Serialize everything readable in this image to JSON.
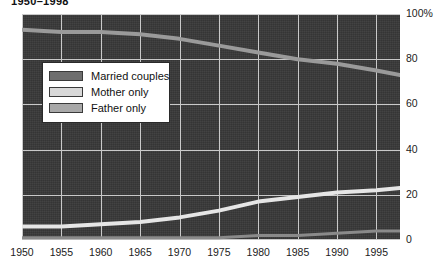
{
  "title": "1950–1998",
  "legend": {
    "items": [
      {
        "label": "Married couples",
        "color": "#6e6e6e",
        "name": "married-couples"
      },
      {
        "label": "Mother only",
        "color": "#d8d8d8",
        "name": "mother-only"
      },
      {
        "label": "Father only",
        "color": "#a8a8a8",
        "name": "father-only"
      }
    ]
  },
  "axes": {
    "y_ticks": [
      "100%",
      "80",
      "60",
      "40",
      "20",
      "0"
    ],
    "x_ticks": [
      "1950",
      "1955",
      "1960",
      "1965",
      "1970",
      "1975",
      "1980",
      "1985",
      "1990",
      "1995"
    ]
  },
  "colors": {
    "plot_background": "#383838",
    "gridline": "#c9c9c9",
    "married": "#9a9a9a",
    "mother": "#e6e6e6",
    "father": "#8a8a8a"
  },
  "chart_data": {
    "type": "line",
    "title": "1950–1998",
    "xlabel": "",
    "ylabel": "",
    "xlim": [
      1950,
      1998
    ],
    "ylim": [
      0,
      100
    ],
    "grid": true,
    "legend_position": "inside-upper-left",
    "x": [
      1950,
      1955,
      1960,
      1965,
      1970,
      1975,
      1980,
      1985,
      1990,
      1995,
      1998
    ],
    "series": [
      {
        "name": "Married couples",
        "color": "#9a9a9a",
        "values": [
          93,
          92,
          92,
          91,
          89,
          86,
          83,
          80,
          78,
          75,
          73
        ]
      },
      {
        "name": "Mother only",
        "color": "#e6e6e6",
        "values": [
          6,
          6,
          7,
          8,
          10,
          13,
          17,
          19,
          21,
          22,
          23
        ]
      },
      {
        "name": "Father only",
        "color": "#8a8a8a",
        "values": [
          1,
          1,
          1,
          1,
          1,
          1,
          2,
          2,
          3,
          4,
          4
        ]
      }
    ]
  }
}
